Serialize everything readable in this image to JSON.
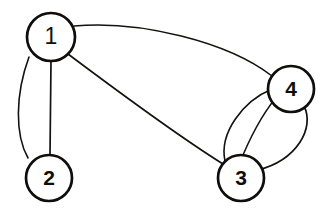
{
  "diagram": {
    "kind": "node-link-graph",
    "canvas": {
      "width": 331,
      "height": 224,
      "background": "#ffffff"
    },
    "style": {
      "node_stroke_color": "#100e0c",
      "node_fill_color": "#ffffff",
      "node_stroke_width": 2.6,
      "edge_stroke_color": "#14120f",
      "edge_stroke_width": 1.5,
      "label_color": "#100e0c"
    },
    "nodes": [
      {
        "id": "1",
        "label": "1",
        "cx": 51,
        "cy": 37,
        "r": 24
      },
      {
        "id": "2",
        "label": "2",
        "cx": 49,
        "cy": 178,
        "r": 23
      },
      {
        "id": "3",
        "label": "3",
        "cx": 241,
        "cy": 178,
        "r": 23
      },
      {
        "id": "4",
        "label": "4",
        "cx": 291,
        "cy": 89,
        "r": 23
      }
    ],
    "edges": [
      {
        "id": "e-1-2-arc",
        "source": "1",
        "target": "2",
        "shape": "arc-left",
        "path": "M 29 57 C 15 95 15 135 28 158"
      },
      {
        "id": "e-1-2-straight",
        "source": "1",
        "target": "2",
        "shape": "straight",
        "path": "M 51 61 L 50 155"
      },
      {
        "id": "e-1-3",
        "source": "1",
        "target": "3",
        "shape": "straight",
        "path": "M 68 54 C 120 93 175 134 223 164"
      },
      {
        "id": "e-1-4",
        "source": "1",
        "target": "4",
        "shape": "arc-up",
        "path": "M 74 26 C 140 20 228 42 272 76"
      },
      {
        "id": "e-3-4-left",
        "source": "3",
        "target": "4",
        "shape": "arc-left",
        "path": "M 225 161 C 219 133 243 101 272 89"
      },
      {
        "id": "e-3-4-middle",
        "source": "3",
        "target": "4",
        "shape": "straight",
        "path": "M 243 155 C 252 134 266 108 281 92"
      },
      {
        "id": "e-3-4-right",
        "source": "3",
        "target": "4",
        "shape": "arc-right",
        "path": "M 258 170 C 297 160 315 128 304 106"
      }
    ],
    "edge_counts": [
      {
        "pair": "1-2",
        "count": 2
      },
      {
        "pair": "1-3",
        "count": 1
      },
      {
        "pair": "1-4",
        "count": 1
      },
      {
        "pair": "3-4",
        "count": 3
      }
    ]
  }
}
